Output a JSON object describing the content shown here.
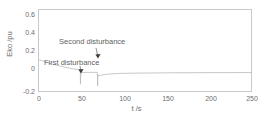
{
  "chart_data": {
    "type": "line",
    "title": "",
    "xlabel": "t /s",
    "ylabel": "Eko /pu",
    "xlim": [
      0,
      250
    ],
    "ylim": [
      -0.2,
      0.7
    ],
    "xticks": [
      0,
      50,
      100,
      150,
      200,
      250
    ],
    "xtick_labels": [
      "0",
      "50",
      "100",
      "150",
      "200",
      "250"
    ],
    "yticks": [
      -0.2,
      0,
      0.2,
      0.4,
      0.6
    ],
    "ytick_labels": [
      "-0.2",
      "0",
      "0.2",
      "0.4",
      "0.6"
    ],
    "grid": false,
    "legend": null,
    "series": [
      {
        "name": "Eko",
        "color": "#b9b9b9",
        "x": [
          0,
          2,
          5,
          8,
          12,
          16,
          20,
          25,
          30,
          35,
          40,
          45,
          49.4,
          49.6,
          50,
          50.4,
          51,
          52,
          55,
          58,
          62,
          66,
          69.4,
          69.6,
          70,
          70.4,
          71,
          72,
          74,
          76,
          78,
          80,
          82,
          85,
          90,
          95,
          100,
          110,
          120,
          130,
          140,
          150,
          165,
          180,
          200,
          220,
          240,
          250
        ],
        "y": [
          0.155,
          0.148,
          0.138,
          0.128,
          0.116,
          0.105,
          0.095,
          0.083,
          0.072,
          0.062,
          0.053,
          0.045,
          0.041,
          -0.115,
          0.012,
          0.012,
          0.012,
          0.012,
          0.012,
          0.012,
          0.013,
          0.013,
          0.013,
          -0.135,
          -0.01,
          -0.02,
          -0.022,
          -0.021,
          -0.018,
          -0.014,
          -0.011,
          -0.008,
          -0.006,
          -0.004,
          -0.001,
          0.001,
          0.002,
          0.004,
          0.005,
          0.006,
          0.007,
          0.008,
          0.009,
          0.009,
          0.01,
          0.01,
          0.011,
          0.011
        ]
      }
    ],
    "annotations": [
      {
        "id": "second-disturbance",
        "text": "Second disturbance",
        "arrow_tip_x": 70,
        "arrow_tip_y": 0.06
      },
      {
        "id": "first-disturbance",
        "text": "First disturbance",
        "arrow_tip_x": 50,
        "arrow_tip_y": 0.0
      }
    ]
  },
  "axes": {
    "ylabel": "Eko /pu",
    "xlabel": "t /s",
    "ytick_labels": [
      "0.6",
      "0.4",
      "0.2",
      "0",
      "-0.2"
    ],
    "xtick_labels": [
      "0",
      "50",
      "100",
      "150",
      "200",
      "250"
    ]
  },
  "annotations": {
    "second": "Second disturbance",
    "first": "First disturbance"
  },
  "colors": {
    "frame": "#c9c9c9",
    "curve": "#b9b9b9",
    "text": "#6e6e6e",
    "background": "#ffffff"
  }
}
